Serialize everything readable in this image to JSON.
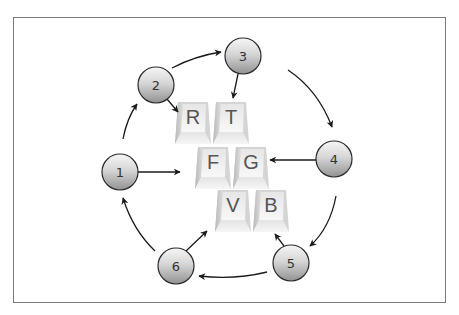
{
  "diagram": {
    "frame": {
      "x": 13,
      "y": 17,
      "width": 433,
      "height": 286,
      "border_color": "#777777"
    },
    "colors": {
      "arrow": "#1a1a1a",
      "node_border": "#2a2a2a",
      "node_fill_top": "#f2f2f2",
      "node_fill_bottom": "#999999",
      "key_face": "#f4f4f4",
      "key_shade": "#c8c8c8",
      "key_text": "#555555"
    },
    "nodes": [
      {
        "id": "1",
        "label": "1",
        "cx": 120,
        "cy": 172,
        "r": 18
      },
      {
        "id": "2",
        "label": "2",
        "cx": 156,
        "cy": 85,
        "r": 18
      },
      {
        "id": "3",
        "label": "3",
        "cx": 243,
        "cy": 56,
        "r": 18
      },
      {
        "id": "4",
        "label": "4",
        "cx": 334,
        "cy": 159,
        "r": 18
      },
      {
        "id": "5",
        "label": "5",
        "cx": 291,
        "cy": 263,
        "r": 18
      },
      {
        "id": "6",
        "label": "6",
        "cx": 176,
        "cy": 266,
        "r": 18
      }
    ],
    "keys": [
      {
        "label": "R",
        "x": 175,
        "y": 102
      },
      {
        "label": "T",
        "x": 213,
        "y": 102
      },
      {
        "label": "F",
        "x": 195,
        "y": 147
      },
      {
        "label": "G",
        "x": 233,
        "y": 147
      },
      {
        "label": "V",
        "x": 215,
        "y": 190
      },
      {
        "label": "B",
        "x": 253,
        "y": 190
      }
    ],
    "edges": [
      {
        "from": "1",
        "to": "2"
      },
      {
        "from": "2",
        "to": "3"
      },
      {
        "from": "3",
        "to": "4"
      },
      {
        "from": "4",
        "to": "5"
      },
      {
        "from": "5",
        "to": "6"
      },
      {
        "from": "6",
        "to": "1"
      },
      {
        "from": "1",
        "to": "key-F"
      },
      {
        "from": "2",
        "to": "key-R"
      },
      {
        "from": "3",
        "to": "key-T"
      },
      {
        "from": "4",
        "to": "key-G"
      },
      {
        "from": "5",
        "to": "key-B"
      },
      {
        "from": "6",
        "to": "key-V"
      }
    ]
  }
}
